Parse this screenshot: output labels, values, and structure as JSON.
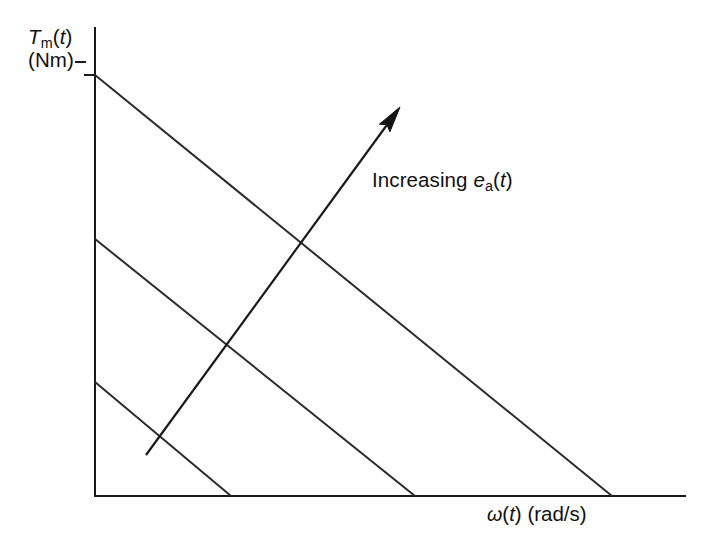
{
  "figure": {
    "background_color": "#ffffff",
    "line_color": "#2b2b2b",
    "text_color": "#111111",
    "width": 717,
    "height": 552
  },
  "axes": {
    "y_label_line1_prefix": "T",
    "y_label_line1_sub": "m",
    "y_label_line1_suffix_open": "(",
    "y_label_line1_var": "t",
    "y_label_line1_suffix_close": ")",
    "y_label_line1_full": "Tm(t)",
    "y_label_line2": "(Nm)",
    "x_label_omega": "ω",
    "x_label_open": "(",
    "x_label_var": "t",
    "x_label_close": ")",
    "x_label_units": " (rad/s)",
    "x_label_full": "ω(t) (rad/s)",
    "origin_x": 95,
    "origin_y": 496,
    "y_axis_top": 28,
    "x_axis_right": 685
  },
  "annotation": {
    "text_prefix": "Increasing ",
    "text_var": "e",
    "text_sub": "a",
    "text_open": "(",
    "text_time_var": "t",
    "text_close": ")",
    "text_full": "Increasing ea(t)"
  },
  "chart_data": {
    "type": "line",
    "xlabel": "ω(t) (rad/s)",
    "ylabel": "Tm(t) (Nm)",
    "xlim": [
      0,
      1.0
    ],
    "ylim": [
      0,
      1.0
    ],
    "grid": false,
    "legend": null,
    "axis_ticks": "none",
    "series": [
      {
        "name": "curve-low-voltage",
        "y_intercept_torque": 0.243,
        "x_intercept_speed": 0.231,
        "slope": -1.053,
        "pixel_start": [
          95,
          382
        ],
        "pixel_end": [
          231,
          496
        ]
      },
      {
        "name": "curve-mid-voltage",
        "y_intercept_torque": 0.549,
        "x_intercept_speed": 0.542,
        "slope": -1.012,
        "pixel_start": [
          95,
          239
        ],
        "pixel_end": [
          415,
          496
        ]
      },
      {
        "name": "curve-high-voltage",
        "y_intercept_torque": 0.9,
        "x_intercept_speed": 0.876,
        "slope": -1.027,
        "pixel_start": [
          95,
          75
        ],
        "pixel_end": [
          612,
          496
        ]
      }
    ],
    "annotations": [
      {
        "name": "increasing-voltage-arrow",
        "label": "Increasing ea(t)",
        "pixel_tail": [
          146,
          455
        ],
        "pixel_tip": [
          400,
          107
        ],
        "direction": "up-right"
      }
    ],
    "tick_marks": [
      {
        "axis": "y",
        "pixel_y": 75,
        "label": ""
      }
    ]
  }
}
